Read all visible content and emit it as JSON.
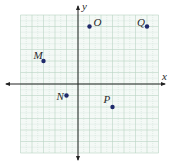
{
  "diagram": {
    "type": "coordinate-plane",
    "axes": {
      "x_label": "x",
      "y_label": "y"
    },
    "grid": {
      "x_min": -5,
      "x_max": 7,
      "y_min": -6,
      "y_max": 6,
      "minor_divisions": 2
    },
    "points": [
      {
        "name": "O",
        "x": 1,
        "y": 5
      },
      {
        "name": "Q",
        "x": 6,
        "y": 5
      },
      {
        "name": "M",
        "x": -3,
        "y": 2
      },
      {
        "name": "N",
        "x": -1,
        "y": -1
      },
      {
        "name": "P",
        "x": 3,
        "y": -2
      }
    ],
    "colors": {
      "grid_major": "#b9d3c4",
      "grid_minor": "#cfe0d6",
      "grid_bg": "#f4f9f6",
      "axis": "#222222",
      "point": "#1f2a6b"
    }
  }
}
